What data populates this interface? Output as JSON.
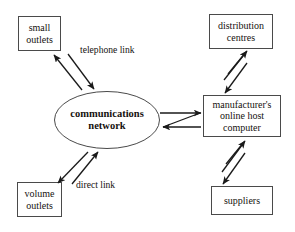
{
  "diagram": {
    "type": "flow-diagram",
    "background_color": "#ffffff",
    "stroke_color": "#1a1a1a",
    "text_color": "#16120f",
    "nodes": [
      {
        "id": "small-outlets",
        "shape": "rectangle",
        "label": "small\noutlets",
        "x": 18,
        "y": 16,
        "w": 43,
        "h": 35
      },
      {
        "id": "distribution-centres",
        "shape": "rectangle",
        "label": "distribution\ncentres",
        "x": 209,
        "y": 14,
        "w": 64,
        "h": 35
      },
      {
        "id": "communications-network",
        "shape": "ellipse",
        "label": "communications\nnetwork",
        "cx": 107,
        "cy": 120,
        "rx": 53,
        "ry": 29
      },
      {
        "id": "manufacturer-host",
        "shape": "rectangle",
        "label": "manufacturer's\nonline host\ncomputer",
        "x": 203,
        "y": 95,
        "w": 78,
        "h": 42
      },
      {
        "id": "volume-outlets",
        "shape": "rectangle",
        "label": "volume\noutlets",
        "x": 17,
        "y": 182,
        "w": 45,
        "h": 35
      },
      {
        "id": "suppliers",
        "shape": "rectangle",
        "label": "suppliers",
        "x": 211,
        "y": 186,
        "w": 62,
        "h": 29
      }
    ],
    "edges": [
      {
        "id": "edge-network-small-outlets",
        "from": "communications-network",
        "to": "small-outlets",
        "style": "double-arrow-v",
        "label": "telephone link"
      },
      {
        "id": "edge-network-volume-outlets",
        "from": "communications-network",
        "to": "volume-outlets",
        "style": "double-arrow-v",
        "label": "direct link"
      },
      {
        "id": "edge-network-manufacturer-host",
        "from": "communications-network",
        "to": "manufacturer-host",
        "style": "double-arrow-z",
        "label": ""
      },
      {
        "id": "edge-manufacturer-host-distribution-centres",
        "from": "manufacturer-host",
        "to": "distribution-centres",
        "style": "double-arrow-z",
        "label": ""
      },
      {
        "id": "edge-manufacturer-host-suppliers",
        "from": "manufacturer-host",
        "to": "suppliers",
        "style": "double-arrow-z",
        "label": ""
      }
    ],
    "edge_labels": [
      {
        "id": "telephone-link-label",
        "text": "telephone link",
        "x": 80,
        "y": 44
      },
      {
        "id": "direct-link-label",
        "text": "direct link",
        "x": 76,
        "y": 179
      }
    ]
  }
}
